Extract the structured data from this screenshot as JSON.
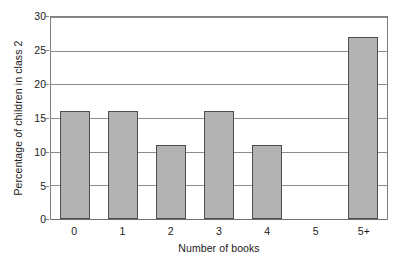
{
  "chart_data": {
    "type": "bar",
    "title": "",
    "subtitle": "",
    "xlabel": "Number of books",
    "ylabel": "Percentage of children in class 2",
    "categories": [
      "0",
      "1",
      "2",
      "3",
      "4",
      "5",
      "5+"
    ],
    "values": [
      16,
      16,
      11,
      16,
      11,
      0,
      27
    ],
    "ylim": [
      0,
      30
    ],
    "ytick_labels": [
      "0",
      "5",
      "10",
      "15",
      "20",
      "25",
      "30"
    ],
    "ytick_values": [
      0,
      5,
      10,
      15,
      20,
      25,
      30
    ],
    "grid": true,
    "grid_axis": "y",
    "legend": false,
    "legend_position": "none",
    "annotations": []
  },
  "style": {
    "bar_fill": "#b3b3b3",
    "bar_border": "#4d4d4d",
    "gridline_color": "#8c8c8c",
    "axis_color": "#808080",
    "text_color": "#1a1a1a",
    "background": "#ffffff"
  }
}
